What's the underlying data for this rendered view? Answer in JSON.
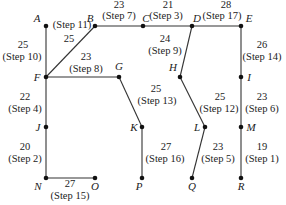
{
  "diagram": {
    "title": "",
    "type": "minimum-spanning-tree",
    "nodes": [
      {
        "id": "A",
        "x": 46,
        "y": 26,
        "lx": 37,
        "ly": 22,
        "anchor": "middle"
      },
      {
        "id": "B",
        "x": 95,
        "y": 26,
        "lx": 90,
        "ly": 22,
        "anchor": "middle"
      },
      {
        "id": "C",
        "x": 143,
        "y": 26,
        "lx": 146,
        "ly": 22,
        "anchor": "middle"
      },
      {
        "id": "D",
        "x": 192,
        "y": 26,
        "lx": 197,
        "ly": 22,
        "anchor": "middle"
      },
      {
        "id": "E",
        "x": 241,
        "y": 26,
        "lx": 249,
        "ly": 22,
        "anchor": "middle"
      },
      {
        "id": "F",
        "x": 46,
        "y": 77,
        "lx": 37,
        "ly": 81,
        "anchor": "middle"
      },
      {
        "id": "G",
        "x": 119,
        "y": 77,
        "lx": 119,
        "ly": 70,
        "anchor": "middle"
      },
      {
        "id": "H",
        "x": 180,
        "y": 77,
        "lx": 173,
        "ly": 71,
        "anchor": "middle"
      },
      {
        "id": "I",
        "x": 241,
        "y": 77,
        "lx": 249,
        "ly": 81,
        "anchor": "middle"
      },
      {
        "id": "J",
        "x": 46,
        "y": 127,
        "lx": 38,
        "ly": 131,
        "anchor": "middle"
      },
      {
        "id": "K",
        "x": 142,
        "y": 127,
        "lx": 134,
        "ly": 131,
        "anchor": "middle"
      },
      {
        "id": "L",
        "x": 205,
        "y": 127,
        "lx": 197,
        "ly": 131,
        "anchor": "middle"
      },
      {
        "id": "M",
        "x": 241,
        "y": 127,
        "lx": 251,
        "ly": 131,
        "anchor": "middle"
      },
      {
        "id": "N",
        "x": 46,
        "y": 178,
        "lx": 38,
        "ly": 190,
        "anchor": "middle"
      },
      {
        "id": "O",
        "x": 95,
        "y": 178,
        "lx": 95,
        "ly": 190,
        "anchor": "middle"
      },
      {
        "id": "P",
        "x": 142,
        "y": 178,
        "lx": 139,
        "ly": 190,
        "anchor": "middle"
      },
      {
        "id": "Q",
        "x": 192,
        "y": 178,
        "lx": 192,
        "ly": 190,
        "anchor": "middle"
      },
      {
        "id": "R",
        "x": 241,
        "y": 178,
        "lx": 241,
        "ly": 190,
        "anchor": "middle"
      }
    ],
    "edges": [
      {
        "from": "A",
        "to": "F",
        "weight": "25",
        "step": "(Step 10)",
        "wx": 23,
        "wy": 48,
        "sx": 22,
        "sy": 60
      },
      {
        "from": "F",
        "to": "B",
        "weight": "25",
        "step": "(Step 11)",
        "wx": 69,
        "wy": 42,
        "sx": 72,
        "sy": 28
      },
      {
        "from": "B",
        "to": "C",
        "weight": "23",
        "step": "(Step 7)",
        "wx": 119,
        "wy": 8,
        "sx": 119,
        "sy": 19
      },
      {
        "from": "C",
        "to": "D",
        "weight": "21",
        "step": "(Step 3)",
        "wx": 168,
        "wy": 8,
        "sx": 166,
        "sy": 19
      },
      {
        "from": "D",
        "to": "E",
        "weight": "28",
        "step": "(Step 17)",
        "wx": 226,
        "wy": 8,
        "sx": 222,
        "sy": 19
      },
      {
        "from": "F",
        "to": "G",
        "weight": "23",
        "step": "(Step 8)",
        "wx": 86,
        "wy": 60,
        "sx": 86,
        "sy": 72
      },
      {
        "from": "D",
        "to": "H",
        "weight": "24",
        "step": "(Step 9)",
        "wx": 165,
        "wy": 42,
        "sx": 165,
        "sy": 54
      },
      {
        "from": "E",
        "to": "I",
        "weight": "26",
        "step": "(Step 14)",
        "wx": 262,
        "wy": 48,
        "sx": 262,
        "sy": 60
      },
      {
        "from": "F",
        "to": "J",
        "weight": "22",
        "step": "(Step 4)",
        "wx": 25,
        "wy": 100,
        "sx": 25,
        "sy": 112
      },
      {
        "from": "G",
        "to": "K",
        "weight": "25",
        "step": "(Step 13)",
        "wx": 156,
        "wy": 92,
        "sx": 157,
        "sy": 104
      },
      {
        "from": "H",
        "to": "L",
        "weight": "25",
        "step": "(Step 12)",
        "wx": 220,
        "wy": 100,
        "sx": 219,
        "sy": 112
      },
      {
        "from": "I",
        "to": "M",
        "weight": "23",
        "step": "(Step 6)",
        "wx": 262,
        "wy": 100,
        "sx": 262,
        "sy": 112
      },
      {
        "from": "J",
        "to": "N",
        "weight": "20",
        "step": "(Step 2)",
        "wx": 25,
        "wy": 150,
        "sx": 25,
        "sy": 162
      },
      {
        "from": "N",
        "to": "O",
        "weight": "27",
        "step": "(Step 15)",
        "wx": 70,
        "wy": 187,
        "sx": 70,
        "sy": 199
      },
      {
        "from": "K",
        "to": "P",
        "weight": "27",
        "step": "(Step 16)",
        "wx": 166,
        "wy": 150,
        "sx": 165,
        "sy": 162
      },
      {
        "from": "L",
        "to": "Q",
        "weight": "23",
        "step": "(Step 5)",
        "wx": 218,
        "wy": 150,
        "sx": 218,
        "sy": 162
      },
      {
        "from": "M",
        "to": "R",
        "weight": "19",
        "step": "(Step 1)",
        "wx": 262,
        "wy": 150,
        "sx": 262,
        "sy": 162
      }
    ]
  }
}
